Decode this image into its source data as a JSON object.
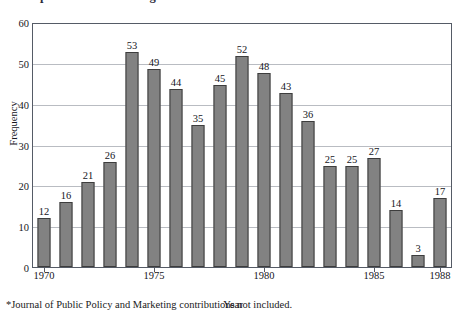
{
  "figure": {
    "title": "Comparison of Marketing Journals",
    "footnote": "*Journal of Public Policy and Marketing contributions not included."
  },
  "chart_data": {
    "type": "bar",
    "title": "Comparison of Marketing Journals",
    "xlabel": "Year",
    "ylabel": "Frequency",
    "ylim": [
      0,
      60
    ],
    "ytick_values": [
      0,
      10,
      20,
      30,
      40,
      50,
      60
    ],
    "ytick_labels": [
      "0",
      "10",
      "20",
      "30",
      "40",
      "50",
      "60"
    ],
    "xtick_labels": [
      "1970",
      "1975",
      "1980",
      "1985",
      "1988"
    ],
    "xtick_categories": [
      "1970",
      "1975",
      "1980",
      "1985",
      "1988"
    ],
    "grid": "horizontal",
    "legend": "none",
    "bar_color": "#828282",
    "bar_edge_color": "#3d3d3d",
    "categories": [
      "1970",
      "1971",
      "1972",
      "1973",
      "1974",
      "1975",
      "1976",
      "1977",
      "1978",
      "1979",
      "1980",
      "1981",
      "1982",
      "1983",
      "1984",
      "1985",
      "1986",
      "1987",
      "1988"
    ],
    "values": [
      12,
      16,
      21,
      26,
      53,
      49,
      44,
      35,
      45,
      52,
      48,
      43,
      36,
      25,
      25,
      27,
      14,
      3,
      17
    ],
    "data_labels": [
      "12",
      "16",
      "21",
      "26",
      "53",
      "49",
      "44",
      "35",
      "45",
      "52",
      "48",
      "43",
      "36",
      "25",
      "25",
      "27",
      "14",
      "3",
      "17"
    ]
  }
}
